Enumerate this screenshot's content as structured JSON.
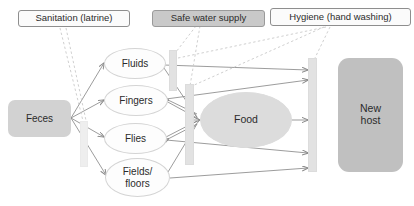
{
  "diagram": {
    "type": "flow-diagram",
    "colors": {
      "source_fill": "#d2d2d2",
      "route_fill": "#fdfdfd",
      "food_fill": "#dcdcdc",
      "host_fill": "#c0c0c0",
      "barrier_fill": "#e2e2e2",
      "chip_gray_fill": "#c9c9c9",
      "chip_light_fill": "#fbfbfb",
      "arrow_stroke": "#8a8a8a",
      "dashed_stroke": "#cccccc",
      "text": "#2b2b2b"
    },
    "interventions": [
      {
        "id": "sanitation",
        "label": "Sanitation (latrine)",
        "style": "light"
      },
      {
        "id": "safe-water",
        "label": "Safe water supply",
        "style": "gray"
      },
      {
        "id": "hygiene",
        "label": "Hygiene (hand washing)",
        "style": "light"
      }
    ],
    "source": {
      "id": "feces",
      "label": "Feces"
    },
    "routes": [
      {
        "id": "fluids",
        "label": "Fluids"
      },
      {
        "id": "fingers",
        "label": "Fingers"
      },
      {
        "id": "flies",
        "label": "Flies"
      },
      {
        "id": "fields",
        "label": "Fields/\nfloors",
        "line1": "Fields/",
        "line2": "floors"
      }
    ],
    "vehicle": {
      "id": "food",
      "label": "Food"
    },
    "destination": {
      "id": "new-host",
      "label": "New\nhost",
      "line1": "New",
      "line2": "host"
    },
    "barriers": [
      {
        "id": "barrier-sanitation",
        "blocks": "feces-to-routes"
      },
      {
        "id": "barrier-water-fluids",
        "blocks": "fluids-onward"
      },
      {
        "id": "barrier-food",
        "blocks": "routes-to-food"
      },
      {
        "id": "barrier-hygiene-host",
        "blocks": "routes-to-new-host"
      }
    ]
  }
}
